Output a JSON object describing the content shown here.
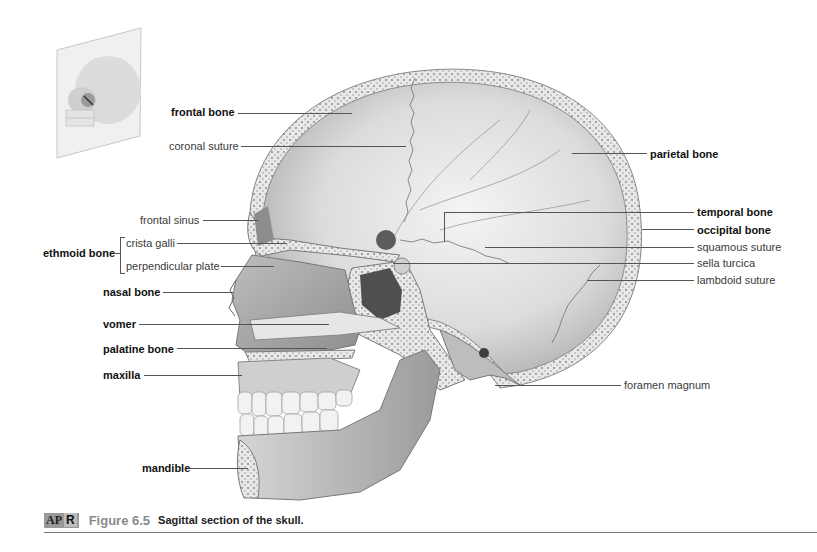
{
  "figure": {
    "badge_left": "AP",
    "badge_right": "R",
    "number": "Figure 6.5",
    "title": "Sagittal section of the skull."
  },
  "labels": {
    "left": [
      {
        "text": "frontal bone",
        "bold": true
      },
      {
        "text": "coronal suture",
        "bold": false
      },
      {
        "text": "frontal sinus",
        "bold": false
      },
      {
        "text": "ethmoid bone",
        "bold": true
      },
      {
        "text": "crista galli",
        "bold": false
      },
      {
        "text": "perpendicular plate",
        "bold": false
      },
      {
        "text": "nasal bone",
        "bold": true
      },
      {
        "text": "vomer",
        "bold": true
      },
      {
        "text": "palatine bone",
        "bold": true
      },
      {
        "text": "maxilla",
        "bold": true
      },
      {
        "text": "mandible",
        "bold": true
      }
    ],
    "right": [
      {
        "text": "parietal bone",
        "bold": true
      },
      {
        "text": "temporal bone",
        "bold": true
      },
      {
        "text": "occipital bone",
        "bold": true
      },
      {
        "text": "squamous suture",
        "bold": false
      },
      {
        "text": "sella turcica",
        "bold": false
      },
      {
        "text": "lambdoid suture",
        "bold": false
      },
      {
        "text": "foramen magnum",
        "bold": false
      }
    ]
  }
}
